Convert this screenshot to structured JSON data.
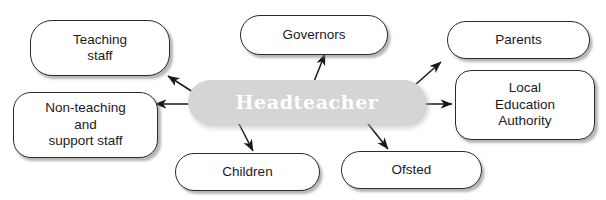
{
  "diagram": {
    "center": {
      "label": "Headteacher",
      "fill_color": "#d5d5d5",
      "text_color": "#ffffff"
    },
    "nodes": [
      {
        "id": "teaching-staff",
        "label": "Teaching\nstaff"
      },
      {
        "id": "governors",
        "label": "Governors"
      },
      {
        "id": "parents",
        "label": "Parents"
      },
      {
        "id": "local-education-authority",
        "label": "Local\nEducation\nAuthority"
      },
      {
        "id": "non-teaching-support-staff",
        "label": "Non-teaching\nand\nsupport staff"
      },
      {
        "id": "children",
        "label": "Children"
      },
      {
        "id": "ofsted",
        "label": "Ofsted"
      }
    ],
    "connections": [
      {
        "from": "headteacher",
        "to": "teaching-staff"
      },
      {
        "from": "headteacher",
        "to": "governors"
      },
      {
        "from": "headteacher",
        "to": "parents"
      },
      {
        "from": "headteacher",
        "to": "local-education-authority"
      },
      {
        "from": "headteacher",
        "to": "non-teaching-support-staff"
      },
      {
        "from": "headteacher",
        "to": "children"
      },
      {
        "from": "headteacher",
        "to": "ofsted"
      }
    ],
    "style": {
      "node_border_color": "#2b2b2b",
      "node_fill_color": "#ffffff",
      "arrow_color": "#1a1a1a",
      "background_color": "#ffffff"
    }
  }
}
